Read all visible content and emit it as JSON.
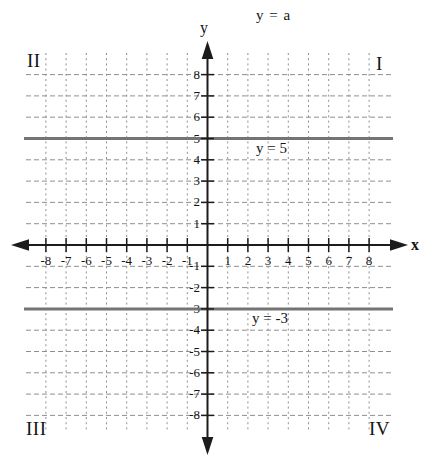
{
  "figure": {
    "title": "y = a",
    "axis_labels": {
      "x": "x",
      "y": "y"
    },
    "quadrants": {
      "q1": "I",
      "q2": "II",
      "q3": "III",
      "q4": "IV"
    },
    "line_labels": [
      "y = 5",
      "y = -3"
    ]
  },
  "colors": {
    "background": "#ffffff",
    "axis": "#1c1c1c",
    "grid": "#8f8f8f",
    "constant_line": "#747474",
    "text": "#141414"
  },
  "chart_data": {
    "type": "line",
    "title": "y = a",
    "xlabel": "x",
    "ylabel": "y",
    "xlim": [
      -9,
      9.5
    ],
    "ylim": [
      -9.5,
      9.5
    ],
    "grid": "dashed",
    "x_ticks": [
      -8,
      -7,
      -6,
      -5,
      -4,
      -3,
      -2,
      -1,
      1,
      2,
      3,
      4,
      5,
      6,
      7,
      8
    ],
    "y_ticks": [
      -8,
      -7,
      -6,
      -5,
      -4,
      -3,
      -2,
      -1,
      1,
      2,
      3,
      4,
      5,
      6,
      7,
      8
    ],
    "quadrant_labels": [
      "I",
      "II",
      "III",
      "IV"
    ],
    "series": [
      {
        "name": "y = 5",
        "equation": "y = 5",
        "type": "horizontal-line",
        "y": 5,
        "x_range": [
          -9,
          9.2
        ],
        "color": "#747474"
      },
      {
        "name": "y = -3",
        "equation": "y = -3",
        "type": "horizontal-line",
        "y": -3,
        "x_range": [
          -9,
          9.2
        ],
        "color": "#747474"
      }
    ]
  }
}
